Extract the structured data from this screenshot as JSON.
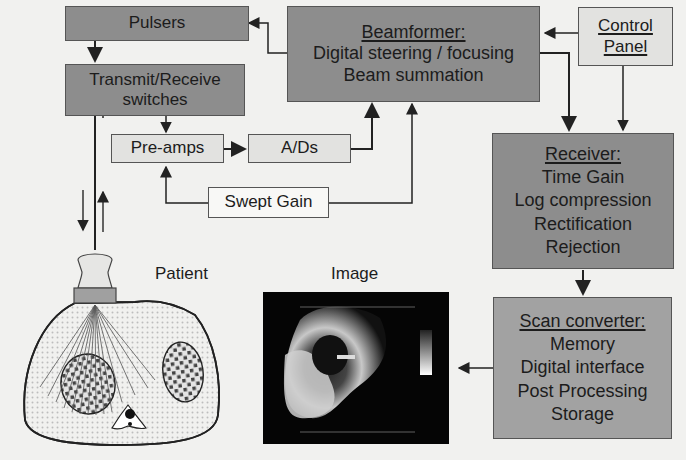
{
  "diagram": {
    "blocks": {
      "pulsers": {
        "label": "Pulsers"
      },
      "tr_switches": {
        "lines": [
          "Transmit/Receive",
          "switches"
        ]
      },
      "beamformer": {
        "heading": "Beamformer:",
        "lines": [
          "Digital steering / focusing",
          "Beam summation"
        ]
      },
      "control_panel": {
        "lines": [
          "Control",
          "Panel"
        ]
      },
      "preamps": {
        "label": "Pre-amps"
      },
      "ads": {
        "label": "A/Ds"
      },
      "swept_gain": {
        "label": "Swept Gain"
      },
      "receiver": {
        "heading": "Receiver:",
        "lines": [
          "Time Gain",
          "Log compression",
          "Rectification",
          "Rejection"
        ]
      },
      "scan_converter": {
        "heading": "Scan converter:",
        "lines": [
          "Memory",
          "Digital interface",
          "Post Processing",
          "Storage"
        ]
      }
    },
    "labels": {
      "patient": "Patient",
      "image": "Image"
    },
    "connections": [
      {
        "from": "beamformer",
        "to": "pulsers"
      },
      {
        "from": "pulsers",
        "to": "tr_switches"
      },
      {
        "from": "tr_switches",
        "to": "preamps"
      },
      {
        "from": "preamps",
        "to": "ads"
      },
      {
        "from": "ads",
        "to": "beamformer"
      },
      {
        "from": "swept_gain",
        "to": "preamps"
      },
      {
        "from": "swept_gain",
        "to": "beamformer"
      },
      {
        "from": "control_panel",
        "to": "beamformer"
      },
      {
        "from": "control_panel",
        "to": "receiver"
      },
      {
        "from": "beamformer",
        "to": "receiver"
      },
      {
        "from": "receiver",
        "to": "scan_converter"
      },
      {
        "from": "scan_converter",
        "to": "image"
      },
      {
        "from": "tr_switches",
        "to": "transducer"
      }
    ],
    "colors": {
      "dark_block": "#8d8d8d",
      "mid_block": "#a2a2a2",
      "light_block": "#e2e2e0",
      "background": "#f1f1ef"
    }
  }
}
